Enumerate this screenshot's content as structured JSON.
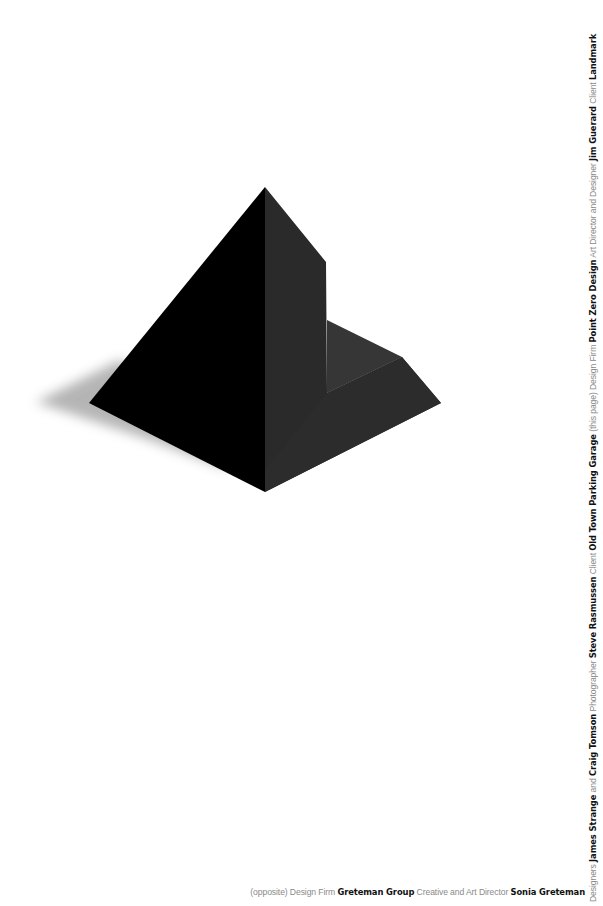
{
  "artwork": {
    "subject": "black-pyramid-with-notch",
    "colors": {
      "left_face": "#000000",
      "right_face": "#2a2a2a",
      "ledge_top": "#363636",
      "notch_wall": "#2f2f2f",
      "shadow": "#9a9a9a",
      "background": "#ffffff"
    }
  },
  "credit_vertical": {
    "parts": [
      {
        "text": "Designers ",
        "style": "light"
      },
      {
        "text": "James Strange",
        "style": "bold"
      },
      {
        "text": " and ",
        "style": "light"
      },
      {
        "text": "Craig Tomson",
        "style": "bold"
      },
      {
        "text": " Photographer ",
        "style": "light"
      },
      {
        "text": "Steve Rasmussen",
        "style": "bold"
      },
      {
        "text": " Client ",
        "style": "light"
      },
      {
        "text": "Old Town Parking Garage",
        "style": "bold"
      },
      {
        "text": " (this page) Design Firm ",
        "style": "light"
      },
      {
        "text": "Point Zero Design",
        "style": "bold"
      },
      {
        "text": " Art Director and Designer ",
        "style": "light"
      },
      {
        "text": "Jim Guerard",
        "style": "bold"
      },
      {
        "text": " Client ",
        "style": "light"
      },
      {
        "text": "Landmark",
        "style": "bold"
      }
    ]
  },
  "credit_horizontal": {
    "parts": [
      {
        "text": "(opposite) Design Firm ",
        "style": "light"
      },
      {
        "text": "Greteman Group",
        "style": "bold"
      },
      {
        "text": " Creative and Art Director ",
        "style": "light"
      },
      {
        "text": "Sonia Greteman",
        "style": "bold"
      }
    ]
  }
}
